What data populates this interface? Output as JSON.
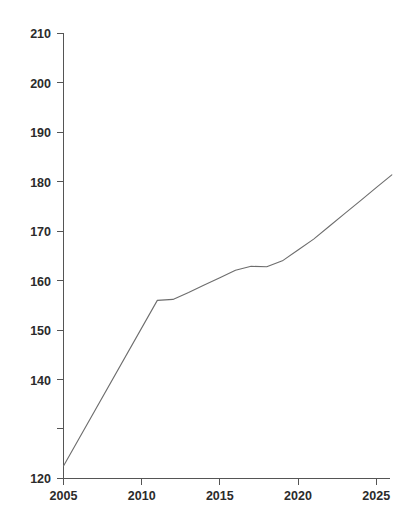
{
  "chart_data": {
    "type": "line",
    "title": "",
    "subtitle": "",
    "xlabel": "",
    "ylabel": "",
    "xlim": [
      2004.0,
      2026.5
    ],
    "ylim": [
      120,
      210
    ],
    "grid": false,
    "legend": null,
    "legend_position": "none",
    "x_ticks": [
      2005,
      2010,
      2015,
      2020,
      2025
    ],
    "x_tick_labels": [
      "2005",
      "2010",
      "2015",
      "2020",
      "2025"
    ],
    "y_ticks": [
      120,
      130,
      140,
      150,
      160,
      170,
      180,
      190,
      200,
      210
    ],
    "y_tick_labels": [
      "120",
      "",
      "140",
      "150",
      "160",
      "170",
      "180",
      "190",
      "200",
      "210"
    ],
    "y_tick_labels_visible": [
      "120",
      "140",
      "150",
      "160",
      "170",
      "180",
      "190",
      "200",
      "210"
    ],
    "series": [
      {
        "name": "series-1",
        "color": "#6d6d6d",
        "x": [
          2005,
          2011,
          2012,
          2013,
          2014,
          2015,
          2016,
          2017,
          2018,
          2019,
          2020,
          2021,
          2022,
          2023,
          2024,
          2025,
          2026
        ],
        "values": [
          122.5,
          156.0,
          156.2,
          157.6,
          159.1,
          160.6,
          162.1,
          162.9,
          162.8,
          164.0,
          166.2,
          168.4,
          171.0,
          173.6,
          176.2,
          178.8,
          181.4
        ]
      }
    ]
  },
  "axes": {
    "y_axis_name": "value-axis",
    "x_axis_name": "year-axis"
  }
}
